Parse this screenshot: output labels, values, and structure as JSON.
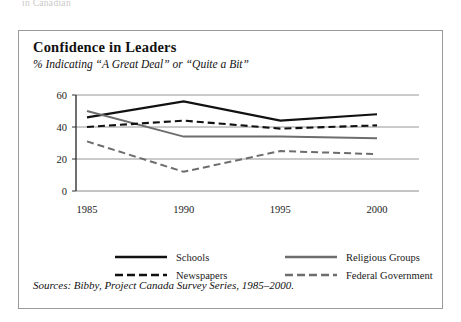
{
  "top_fragment": "in Canadian",
  "figure": {
    "title": "Confidence in Leaders",
    "subtitle": "% Indicating “A Great Deal” or “Quite a Bit”",
    "source": "Sources: Bibby, Project Canada Survey Series, 1985–2000."
  },
  "colors": {
    "black_series": "#111111",
    "gray_series": "#6d6d6d",
    "gridline": "#8a8a8a",
    "axis": "#333333",
    "border": "#9a9a9a",
    "background": "#ffffff"
  },
  "axis": {
    "y_ticks": [
      "0",
      "20",
      "40",
      "60"
    ],
    "x_ticks": [
      "1985",
      "1990",
      "1995",
      "2000"
    ]
  },
  "legend": {
    "entries": [
      {
        "label": "Schools",
        "style": "solid",
        "color": "#111111"
      },
      {
        "label": "Religious Groups",
        "style": "solid",
        "color": "#6d6d6d"
      },
      {
        "label": "Newspapers",
        "style": "dashed",
        "color": "#111111"
      },
      {
        "label": "Federal Government",
        "style": "dashed",
        "color": "#6d6d6d"
      }
    ]
  },
  "chart_data": {
    "type": "line",
    "title": "Confidence in Leaders",
    "subtitle": "% Indicating “A Great Deal” or “Quite a Bit”",
    "xlabel": "",
    "ylabel": "",
    "categories": [
      "1985",
      "1990",
      "1995",
      "2000"
    ],
    "x": [
      1985,
      1990,
      1995,
      2000
    ],
    "ylim": [
      0,
      60
    ],
    "yticks": [
      0,
      20,
      40,
      60
    ],
    "grid": "horizontal",
    "legend_position": "bottom",
    "series": [
      {
        "name": "Schools",
        "style": "solid",
        "color": "#111111",
        "values": [
          46,
          56,
          44,
          48
        ]
      },
      {
        "name": "Religious Groups",
        "style": "solid",
        "color": "#6d6d6d",
        "values": [
          50,
          34,
          34,
          33
        ]
      },
      {
        "name": "Newspapers",
        "style": "dashed",
        "color": "#111111",
        "values": [
          40,
          44,
          39,
          41
        ]
      },
      {
        "name": "Federal Government",
        "style": "dashed",
        "color": "#6d6d6d",
        "values": [
          31,
          12,
          25,
          23
        ]
      }
    ],
    "source": "Sources: Bibby, Project Canada Survey Series, 1985–2000."
  }
}
